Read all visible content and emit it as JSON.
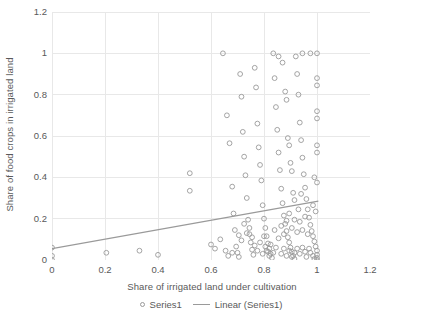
{
  "chart_data": {
    "type": "scatter",
    "title": "",
    "xlabel": "Share of irrigated land under cultivation",
    "ylabel": "Share of food crops in irrigated land",
    "xlim": [
      0,
      1.2
    ],
    "ylim": [
      0,
      1.2
    ],
    "xticks": [
      "0",
      "0.2",
      "0.4",
      "0.6",
      "0.8",
      "1",
      "1.2"
    ],
    "xtick_values": [
      0,
      0.2,
      0.4,
      0.6,
      0.8,
      1,
      1.2
    ],
    "yticks": [
      "0",
      "0.2",
      "0.4",
      "0.6",
      "0.8",
      "1",
      "1.2"
    ],
    "ytick_values": [
      0,
      0.2,
      0.4,
      0.6,
      0.8,
      1,
      1.2
    ],
    "grid": true,
    "grid_color": "#e8e8e8",
    "marker_color": "#9a9a9a",
    "marker_style": "open-circle",
    "legend_position": "bottom",
    "legend": [
      {
        "name": "Series1",
        "marker": "open-circle"
      },
      {
        "name": "Linear (Series1)",
        "marker": "line"
      }
    ],
    "series": [
      {
        "name": "Series1",
        "points": [
          [
            0.0,
            0.06
          ],
          [
            0.0,
            0.02
          ],
          [
            0.0,
            0.0
          ],
          [
            0.205,
            0.035
          ],
          [
            0.33,
            0.045
          ],
          [
            0.4,
            0.025
          ],
          [
            0.52,
            0.42
          ],
          [
            0.52,
            0.335
          ],
          [
            0.6,
            0.075
          ],
          [
            0.615,
            0.055
          ],
          [
            0.635,
            0.1
          ],
          [
            0.645,
            1.0
          ],
          [
            0.66,
            0.7
          ],
          [
            0.67,
            0.565
          ],
          [
            0.68,
            0.355
          ],
          [
            0.685,
            0.225
          ],
          [
            0.69,
            0.145
          ],
          [
            0.695,
            0.065
          ],
          [
            0.7,
            0.035
          ],
          [
            0.705,
            0.015
          ],
          [
            0.71,
            0.9
          ],
          [
            0.715,
            0.79
          ],
          [
            0.72,
            0.62
          ],
          [
            0.725,
            0.5
          ],
          [
            0.73,
            0.41
          ],
          [
            0.735,
            0.3
          ],
          [
            0.74,
            0.195
          ],
          [
            0.745,
            0.125
          ],
          [
            0.75,
            0.085
          ],
          [
            0.755,
            0.05
          ],
          [
            0.76,
            0.025
          ],
          [
            0.765,
            0.93
          ],
          [
            0.77,
            0.835
          ],
          [
            0.775,
            0.66
          ],
          [
            0.78,
            0.545
          ],
          [
            0.785,
            0.46
          ],
          [
            0.79,
            0.385
          ],
          [
            0.795,
            0.265
          ],
          [
            0.8,
            0.2
          ],
          [
            0.805,
            0.155
          ],
          [
            0.81,
            0.115
          ],
          [
            0.815,
            0.08
          ],
          [
            0.82,
            0.055
          ],
          [
            0.825,
            0.03
          ],
          [
            0.83,
            0.01
          ],
          [
            0.835,
            1.0
          ],
          [
            0.84,
            0.88
          ],
          [
            0.845,
            0.74
          ],
          [
            0.85,
            0.63
          ],
          [
            0.855,
            0.52
          ],
          [
            0.86,
            0.435
          ],
          [
            0.865,
            0.345
          ],
          [
            0.87,
            0.275
          ],
          [
            0.875,
            0.215
          ],
          [
            0.88,
            0.175
          ],
          [
            0.885,
            0.14
          ],
          [
            0.89,
            0.11
          ],
          [
            0.895,
            0.085
          ],
          [
            0.9,
            0.06
          ],
          [
            0.905,
            0.04
          ],
          [
            0.91,
            0.02
          ],
          [
            0.915,
            0.005
          ],
          [
            0.855,
            0.985
          ],
          [
            0.87,
            0.955
          ],
          [
            0.88,
            0.815
          ],
          [
            0.885,
            0.775
          ],
          [
            0.89,
            0.59
          ],
          [
            0.895,
            0.555
          ],
          [
            0.9,
            0.47
          ],
          [
            0.905,
            0.43
          ],
          [
            0.91,
            0.325
          ],
          [
            0.915,
            0.29
          ],
          [
            0.92,
            0.985
          ],
          [
            0.925,
            0.9
          ],
          [
            0.93,
            0.8
          ],
          [
            0.935,
            0.665
          ],
          [
            0.94,
            0.58
          ],
          [
            0.945,
            0.495
          ],
          [
            0.95,
            0.415
          ],
          [
            0.955,
            0.35
          ],
          [
            0.96,
            0.295
          ],
          [
            0.965,
            0.245
          ],
          [
            0.97,
            0.205
          ],
          [
            0.975,
            0.17
          ],
          [
            0.98,
            0.14
          ],
          [
            0.985,
            0.115
          ],
          [
            0.99,
            0.09
          ],
          [
            0.995,
            0.065
          ],
          [
            1.0,
            0.045
          ],
          [
            1.0,
            0.025
          ],
          [
            1.0,
            0.01
          ],
          [
            1.0,
            0.0
          ],
          [
            0.945,
            1.0
          ],
          [
            0.975,
            1.0
          ],
          [
            1.0,
            1.0
          ],
          [
            1.0,
            0.88
          ],
          [
            1.0,
            0.845
          ],
          [
            1.0,
            0.72
          ],
          [
            1.0,
            0.685
          ],
          [
            1.0,
            0.555
          ],
          [
            1.0,
            0.52
          ],
          [
            0.99,
            0.4
          ],
          [
            1.0,
            0.375
          ],
          [
            0.985,
            0.265
          ],
          [
            0.995,
            0.235
          ],
          [
            0.97,
            0.055
          ],
          [
            0.975,
            0.035
          ],
          [
            0.985,
            0.02
          ],
          [
            0.99,
            0.005
          ],
          [
            0.96,
            0.015
          ],
          [
            0.955,
            0.04
          ],
          [
            0.945,
            0.06
          ],
          [
            0.935,
            0.03
          ],
          [
            0.925,
            0.055
          ],
          [
            0.915,
            0.035
          ],
          [
            0.905,
            0.015
          ],
          [
            0.895,
            0.045
          ],
          [
            0.885,
            0.02
          ],
          [
            0.875,
            0.055
          ],
          [
            0.865,
            0.03
          ],
          [
            0.845,
            0.06
          ],
          [
            0.835,
            0.035
          ],
          [
            0.825,
            0.075
          ],
          [
            0.815,
            0.04
          ],
          [
            0.805,
            0.065
          ],
          [
            0.795,
            0.03
          ],
          [
            0.785,
            0.085
          ],
          [
            0.775,
            0.045
          ],
          [
            0.765,
            0.07
          ],
          [
            0.755,
            0.11
          ],
          [
            0.745,
            0.155
          ],
          [
            0.735,
            0.13
          ],
          [
            0.725,
            0.175
          ],
          [
            0.715,
            0.095
          ],
          [
            0.705,
            0.12
          ],
          [
            0.84,
            0.145
          ],
          [
            0.855,
            0.105
          ],
          [
            0.865,
            0.165
          ],
          [
            0.875,
            0.125
          ],
          [
            0.885,
            0.19
          ],
          [
            0.895,
            0.225
          ],
          [
            0.905,
            0.155
          ],
          [
            0.915,
            0.195
          ],
          [
            0.925,
            0.135
          ],
          [
            0.935,
            0.185
          ],
          [
            0.945,
            0.145
          ],
          [
            0.955,
            0.21
          ],
          [
            0.965,
            0.125
          ],
          [
            0.93,
            0.245
          ],
          [
            0.94,
            0.32
          ],
          [
            0.8,
            0.115
          ],
          [
            0.81,
            0.045
          ],
          [
            0.82,
            0.02
          ],
          [
            0.68,
            0.035
          ],
          [
            0.665,
            0.02
          ],
          [
            0.655,
            0.045
          ]
        ]
      }
    ],
    "trendline": {
      "name": "Linear (Series1)",
      "x0": 0.0,
      "y0": 0.055,
      "x1": 1.005,
      "y1": 0.285,
      "color": "#9a9a9a"
    }
  }
}
